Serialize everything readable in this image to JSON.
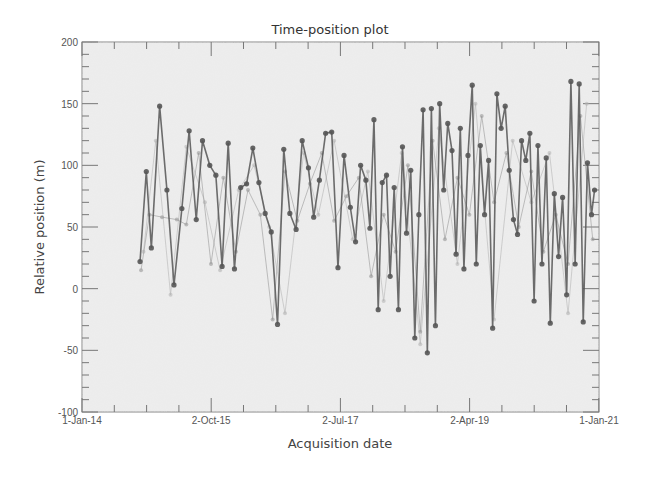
{
  "chart_data": {
    "type": "line",
    "title": "Time-position plot",
    "xlabel": "Acquisition date",
    "ylabel": "Relative position (m)",
    "ylim": [
      -100,
      200
    ],
    "xlim": [
      "2014-01-01",
      "2021-01-01"
    ],
    "yticks": [
      -100,
      -50,
      0,
      50,
      100,
      150,
      200
    ],
    "ytick_labels": [
      "-100",
      "-50",
      "0",
      "50",
      "100",
      "150",
      "200"
    ],
    "xticks": [
      "2014-01-01",
      "2015-10-02",
      "2017-07-02",
      "2019-04-02",
      "2021-01-01"
    ],
    "xtick_labels": [
      "1-Jan-14",
      "2-Oct-15",
      "2-Jul-17",
      "2-Apr-19",
      "1-Jan-21"
    ],
    "grid": false,
    "legend": null,
    "markers": true,
    "series": [
      {
        "name": "main",
        "color": "#555555",
        "x": [
          "2014-10-15",
          "2014-11-15",
          "2014-12-10",
          "2015-01-20",
          "2015-02-25",
          "2015-04-01",
          "2015-05-10",
          "2015-06-15",
          "2015-07-20",
          "2015-08-20",
          "2015-09-25",
          "2015-10-25",
          "2015-11-25",
          "2015-12-25",
          "2016-01-25",
          "2016-02-25",
          "2016-03-25",
          "2016-04-25",
          "2016-05-25",
          "2016-06-25",
          "2016-07-25",
          "2016-08-25",
          "2016-09-25",
          "2016-10-25",
          "2016-11-25",
          "2016-12-25",
          "2017-01-25",
          "2017-02-20",
          "2017-03-20",
          "2017-04-20",
          "2017-05-20",
          "2017-06-20",
          "2017-07-20",
          "2017-08-20",
          "2017-09-15",
          "2017-10-10",
          "2017-11-05",
          "2017-11-25",
          "2017-12-15",
          "2018-01-05",
          "2018-01-25",
          "2018-02-15",
          "2018-03-05",
          "2018-03-25",
          "2018-04-15",
          "2018-05-05",
          "2018-05-25",
          "2018-06-15",
          "2018-07-05",
          "2018-07-25",
          "2018-08-15",
          "2018-09-05",
          "2018-09-25",
          "2018-10-15",
          "2018-11-05",
          "2018-11-25",
          "2018-12-15",
          "2019-01-05",
          "2019-01-25",
          "2019-02-15",
          "2019-03-05",
          "2019-03-25",
          "2019-04-15",
          "2019-05-05",
          "2019-05-25",
          "2019-06-15",
          "2019-07-05",
          "2019-07-25",
          "2019-08-15",
          "2019-09-05",
          "2019-09-25",
          "2019-10-15",
          "2019-11-05",
          "2019-11-25",
          "2019-12-15",
          "2020-01-05",
          "2020-01-25",
          "2020-02-15",
          "2020-03-05",
          "2020-03-25",
          "2020-04-15",
          "2020-05-05",
          "2020-05-25",
          "2020-06-15",
          "2020-07-05",
          "2020-07-25",
          "2020-08-15",
          "2020-09-05",
          "2020-09-25",
          "2020-10-15",
          "2020-11-05",
          "2020-11-25",
          "2020-12-10"
        ],
        "y": [
          22,
          95,
          33,
          148,
          80,
          3,
          65,
          128,
          56,
          120,
          100,
          92,
          18,
          118,
          16,
          82,
          85,
          114,
          86,
          61,
          46,
          -29,
          113,
          61,
          48,
          120,
          98,
          58,
          88,
          126,
          127,
          17,
          108,
          66,
          38,
          100,
          88,
          49,
          137,
          -17,
          86,
          92,
          10,
          82,
          -17,
          115,
          45,
          96,
          -40,
          60,
          145,
          -52,
          146,
          -30,
          150,
          80,
          134,
          112,
          28,
          130,
          16,
          108,
          165,
          20,
          116,
          60,
          104,
          -32,
          158,
          130,
          148,
          96,
          56,
          44,
          120,
          104,
          126,
          -10,
          116,
          20,
          106,
          -28,
          77,
          26,
          74,
          -5,
          168,
          20,
          166,
          -27,
          102,
          60,
          80
        ]
      },
      {
        "name": "faint-1",
        "color": "#9a9a9a",
        "x": [
          "2014-10-20",
          "2014-12-01",
          "2015-02-01",
          "2015-04-15",
          "2015-06-01",
          "2015-08-01",
          "2015-10-01",
          "2015-12-01",
          "2016-02-01",
          "2016-04-01",
          "2016-06-01",
          "2016-08-01",
          "2016-10-01",
          "2016-12-01",
          "2017-02-01",
          "2017-04-01",
          "2017-06-01",
          "2017-08-01",
          "2017-10-01",
          "2017-12-01",
          "2018-02-01",
          "2018-04-01",
          "2018-06-01",
          "2018-08-01",
          "2018-10-01",
          "2018-12-01",
          "2019-02-01",
          "2019-04-01",
          "2019-06-01",
          "2019-08-01",
          "2019-10-01",
          "2019-12-01",
          "2020-02-01",
          "2020-04-01",
          "2020-06-01",
          "2020-08-01",
          "2020-10-01",
          "2020-12-01"
        ],
        "y": [
          15,
          60,
          58,
          56,
          52,
          110,
          20,
          90,
          30,
          80,
          60,
          -25,
          95,
          55,
          85,
          110,
          55,
          75,
          90,
          10,
          60,
          30,
          100,
          -35,
          120,
          40,
          90,
          60,
          140,
          70,
          110,
          50,
          95,
          30,
          60,
          20,
          140,
          40
        ]
      },
      {
        "name": "faint-2",
        "color": "#b5b5b5",
        "x": [
          "2014-11-01",
          "2015-01-01",
          "2015-03-15",
          "2015-06-01",
          "2015-09-01",
          "2015-11-15",
          "2016-02-15",
          "2016-05-01",
          "2016-07-15",
          "2016-10-01",
          "2017-01-01",
          "2017-03-15",
          "2017-06-01",
          "2017-09-01",
          "2017-11-15",
          "2018-02-01",
          "2018-05-01",
          "2018-08-01",
          "2018-11-01",
          "2019-02-01",
          "2019-05-01",
          "2019-08-01",
          "2019-11-01",
          "2020-02-01",
          "2020-05-01",
          "2020-08-01",
          "2020-11-01"
        ],
        "y": [
          30,
          120,
          -5,
          115,
          70,
          15,
          80,
          100,
          50,
          -20,
          110,
          60,
          120,
          40,
          95,
          -10,
          110,
          -45,
          130,
          20,
          150,
          -25,
          120,
          70,
          110,
          -20,
          150
        ]
      }
    ]
  }
}
